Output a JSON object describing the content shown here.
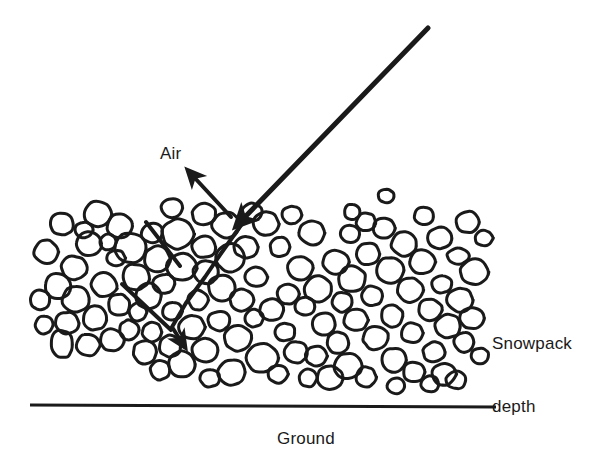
{
  "figure": {
    "type": "diagram",
    "background_color": "#ffffff",
    "ink_color": "#1a1a1a",
    "width": 594,
    "height": 465
  },
  "labels": {
    "air": "Air",
    "snowpack_line1": "Snowpack",
    "snowpack_line2": "depth",
    "ground": "Ground"
  },
  "diagram_data": {
    "ground_line": {
      "x1": 30,
      "y1": 405,
      "x2": 496,
      "y2": 407,
      "stroke_width": 3
    },
    "incident_ray": {
      "name": "incoming-solar-ray",
      "points": [
        [
          428,
          28
        ],
        [
          243,
          219
        ]
      ],
      "stroke_width": 5,
      "arrowhead": "end"
    },
    "escape_ray": {
      "name": "reflected-ray-to-air",
      "points": [
        [
          231,
          217
        ],
        [
          193,
          176
        ]
      ],
      "stroke_width": 4,
      "arrowhead": "end"
    },
    "scatter_paths": [
      {
        "name": "scatter-path-main",
        "points": [
          [
            244,
            221
          ],
          [
            222,
            252
          ],
          [
            205,
            277
          ],
          [
            186,
            303
          ],
          [
            172,
            327
          ],
          [
            181,
            341
          ]
        ],
        "stroke_width": 4,
        "arrowhead": "end"
      },
      {
        "name": "scatter-path-upper-left",
        "points": [
          [
            146,
            222
          ],
          [
            180,
            266
          ]
        ],
        "stroke_width": 4,
        "arrowhead": "none"
      },
      {
        "name": "scatter-path-lower-left",
        "points": [
          [
            122,
            284
          ],
          [
            171,
            330
          ]
        ],
        "stroke_width": 4,
        "arrowhead": "none"
      }
    ],
    "grain_count": 112,
    "grain_stroke_width": 3,
    "grains": [
      [
        62,
        224,
        12,
        11,
        8
      ],
      [
        89,
        244,
        13,
        12,
        -14
      ],
      [
        46,
        252,
        12,
        12,
        0
      ],
      [
        74,
        268,
        13,
        12,
        20
      ],
      [
        98,
        214,
        14,
        13,
        0
      ],
      [
        58,
        286,
        13,
        13,
        10
      ],
      [
        40,
        300,
        10,
        10,
        0
      ],
      [
        76,
        299,
        14,
        13,
        -8
      ],
      [
        104,
        285,
        13,
        12,
        15
      ],
      [
        44,
        325,
        9,
        9,
        0
      ],
      [
        67,
        323,
        12,
        11,
        0
      ],
      [
        95,
        318,
        12,
        12,
        10
      ],
      [
        119,
        305,
        11,
        11,
        0
      ],
      [
        62,
        344,
        11,
        14,
        -10
      ],
      [
        88,
        345,
        12,
        11,
        0
      ],
      [
        112,
        340,
        12,
        11,
        0
      ],
      [
        130,
        248,
        16,
        15,
        0
      ],
      [
        136,
        277,
        14,
        13,
        8
      ],
      [
        120,
        226,
        13,
        12,
        0
      ],
      [
        152,
        233,
        11,
        10,
        0
      ],
      [
        157,
        259,
        13,
        13,
        0
      ],
      [
        148,
        296,
        13,
        13,
        -6
      ],
      [
        129,
        330,
        10,
        10,
        0
      ],
      [
        152,
        332,
        10,
        10,
        0
      ],
      [
        145,
        352,
        12,
        12,
        0
      ],
      [
        170,
        346,
        11,
        11,
        0
      ],
      [
        172,
        311,
        10,
        9,
        0
      ],
      [
        178,
        234,
        16,
        15,
        0
      ],
      [
        182,
        267,
        15,
        14,
        5
      ],
      [
        164,
        284,
        11,
        10,
        0
      ],
      [
        204,
        247,
        12,
        11,
        0
      ],
      [
        206,
        272,
        13,
        12,
        0
      ],
      [
        198,
        300,
        10,
        10,
        0
      ],
      [
        192,
        327,
        13,
        12,
        0
      ],
      [
        182,
        364,
        13,
        13,
        0
      ],
      [
        205,
        350,
        13,
        12,
        0
      ],
      [
        219,
        321,
        11,
        10,
        0
      ],
      [
        222,
        288,
        14,
        13,
        10
      ],
      [
        226,
        225,
        14,
        13,
        0
      ],
      [
        230,
        258,
        14,
        14,
        -8
      ],
      [
        246,
        247,
        12,
        11,
        0
      ],
      [
        242,
        300,
        12,
        11,
        0
      ],
      [
        238,
        338,
        14,
        13,
        0
      ],
      [
        232,
        372,
        14,
        13,
        0
      ],
      [
        256,
        277,
        11,
        10,
        0
      ],
      [
        262,
        358,
        16,
        15,
        0
      ],
      [
        266,
        224,
        13,
        12,
        0
      ],
      [
        280,
        247,
        10,
        10,
        0
      ],
      [
        272,
        310,
        12,
        11,
        0
      ],
      [
        285,
        332,
        10,
        9,
        0
      ],
      [
        296,
        352,
        12,
        11,
        0
      ],
      [
        288,
        294,
        11,
        10,
        0
      ],
      [
        300,
        268,
        13,
        12,
        0
      ],
      [
        312,
        233,
        13,
        12,
        0
      ],
      [
        305,
        306,
        10,
        9,
        0
      ],
      [
        318,
        289,
        14,
        13,
        0
      ],
      [
        324,
        324,
        12,
        11,
        0
      ],
      [
        316,
        356,
        11,
        10,
        0
      ],
      [
        336,
        262,
        13,
        12,
        0
      ],
      [
        342,
        302,
        10,
        10,
        0
      ],
      [
        338,
        343,
        11,
        11,
        0
      ],
      [
        350,
        234,
        10,
        9,
        0
      ],
      [
        352,
        279,
        14,
        13,
        0
      ],
      [
        356,
        320,
        12,
        11,
        0
      ],
      [
        348,
        366,
        14,
        13,
        0
      ],
      [
        330,
        378,
        13,
        12,
        0
      ],
      [
        368,
        254,
        12,
        11,
        0
      ],
      [
        372,
        296,
        11,
        10,
        0
      ],
      [
        376,
        338,
        13,
        12,
        0
      ],
      [
        366,
        377,
        10,
        10,
        0
      ],
      [
        384,
        228,
        11,
        10,
        0
      ],
      [
        390,
        270,
        14,
        13,
        0
      ],
      [
        392,
        316,
        11,
        11,
        0
      ],
      [
        394,
        360,
        13,
        12,
        0
      ],
      [
        404,
        244,
        13,
        12,
        0
      ],
      [
        410,
        290,
        13,
        12,
        0
      ],
      [
        412,
        333,
        11,
        10,
        0
      ],
      [
        414,
        372,
        11,
        10,
        0
      ],
      [
        352,
        212,
        8,
        8,
        0
      ],
      [
        366,
        222,
        10,
        9,
        0
      ],
      [
        424,
        216,
        10,
        9,
        0
      ],
      [
        422,
        262,
        13,
        12,
        0
      ],
      [
        430,
        310,
        12,
        11,
        0
      ],
      [
        434,
        352,
        11,
        10,
        0
      ],
      [
        440,
        238,
        12,
        11,
        0
      ],
      [
        442,
        284,
        10,
        9,
        0
      ],
      [
        448,
        326,
        13,
        12,
        0
      ],
      [
        444,
        374,
        12,
        11,
        0
      ],
      [
        458,
        256,
        11,
        8,
        0
      ],
      [
        460,
        300,
        13,
        12,
        0
      ],
      [
        464,
        342,
        10,
        10,
        0
      ],
      [
        456,
        380,
        10,
        9,
        0
      ],
      [
        468,
        222,
        12,
        11,
        0
      ],
      [
        474,
        272,
        14,
        13,
        0
      ],
      [
        472,
        318,
        12,
        11,
        0
      ],
      [
        252,
        212,
        10,
        9,
        0
      ],
      [
        292,
        215,
        10,
        9,
        0
      ],
      [
        172,
        208,
        11,
        10,
        0
      ],
      [
        204,
        214,
        12,
        11,
        0
      ],
      [
        116,
        258,
        9,
        8,
        0
      ],
      [
        108,
        242,
        8,
        8,
        0
      ],
      [
        84,
        230,
        9,
        8,
        0
      ],
      [
        138,
        312,
        9,
        9,
        0
      ],
      [
        160,
        370,
        10,
        10,
        0
      ],
      [
        210,
        378,
        10,
        9,
        0
      ],
      [
        254,
        318,
        9,
        9,
        0
      ],
      [
        278,
        374,
        10,
        9,
        0
      ],
      [
        308,
        378,
        9,
        9,
        0
      ],
      [
        386,
        196,
        8,
        7,
        0
      ],
      [
        430,
        384,
        9,
        8,
        0
      ],
      [
        396,
        386,
        9,
        8,
        0
      ],
      [
        480,
        356,
        9,
        8,
        0
      ],
      [
        484,
        238,
        9,
        8,
        0
      ]
    ]
  }
}
